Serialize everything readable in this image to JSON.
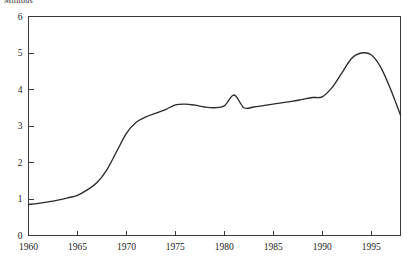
{
  "chart_data": {
    "type": "line",
    "title": "Millions",
    "subtitle": "",
    "xlabel": "",
    "ylabel": "Millions",
    "xlim": [
      1960,
      1998
    ],
    "ylim": [
      0,
      6
    ],
    "grid": false,
    "legend": null,
    "y_ticks": [
      0,
      1,
      2,
      3,
      4,
      5,
      6
    ],
    "y_tick_labels": [
      "0",
      "1",
      "2",
      "3",
      "4",
      "5",
      "6"
    ],
    "x_ticks": [
      1960,
      1965,
      1970,
      1975,
      1980,
      1985,
      1990,
      1995
    ],
    "x_tick_labels": [
      "1960",
      "1965",
      "1970",
      "1975",
      "1980",
      "1985",
      "1990",
      "1995"
    ],
    "line_color": "#2b2b2b",
    "axis_color": "#3a3a3a",
    "series": [
      {
        "name": "value",
        "x": [
          1960,
          1961,
          1962,
          1963,
          1964,
          1965,
          1966,
          1967,
          1968,
          1969,
          1970,
          1971,
          1972,
          1973,
          1974,
          1975,
          1976,
          1977,
          1978,
          1979,
          1980,
          1981,
          1982,
          1983,
          1984,
          1985,
          1986,
          1987,
          1988,
          1989,
          1990,
          1991,
          1992,
          1993,
          1994,
          1995,
          1996,
          1997,
          1998
        ],
        "values": [
          0.85,
          0.88,
          0.92,
          0.97,
          1.03,
          1.1,
          1.25,
          1.45,
          1.8,
          2.3,
          2.8,
          3.1,
          3.25,
          3.35,
          3.45,
          3.58,
          3.6,
          3.57,
          3.52,
          3.5,
          3.55,
          3.85,
          3.5,
          3.52,
          3.56,
          3.6,
          3.64,
          3.68,
          3.73,
          3.78,
          3.8,
          4.05,
          4.45,
          4.85,
          5.0,
          4.95,
          4.6,
          4.0,
          3.3
        ]
      }
    ]
  }
}
